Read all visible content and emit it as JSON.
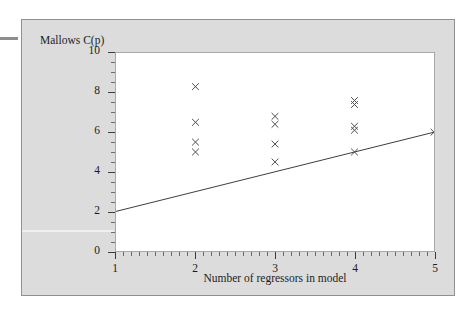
{
  "chart_data": {
    "type": "scatter",
    "title": "",
    "xlabel": "Number of regressors in model",
    "ylabel": "Mallows C(p)",
    "xlim": [
      1,
      5
    ],
    "ylim": [
      0,
      10
    ],
    "xticks": [
      "1",
      "2",
      "3",
      "4",
      "5"
    ],
    "yticks": [
      "0",
      "2",
      "4",
      "6",
      "8",
      "10"
    ],
    "grid": false,
    "legend": null,
    "marker": "x",
    "points": [
      {
        "x": 2,
        "y": 8.3
      },
      {
        "x": 2,
        "y": 6.5
      },
      {
        "x": 2,
        "y": 5.5
      },
      {
        "x": 2,
        "y": 5.0
      },
      {
        "x": 3,
        "y": 6.8
      },
      {
        "x": 3,
        "y": 6.4
      },
      {
        "x": 3,
        "y": 5.4
      },
      {
        "x": 3,
        "y": 4.5
      },
      {
        "x": 4,
        "y": 7.6
      },
      {
        "x": 4,
        "y": 7.4
      },
      {
        "x": 4,
        "y": 6.3
      },
      {
        "x": 4,
        "y": 6.1
      },
      {
        "x": 4,
        "y": 5.0
      },
      {
        "x": 5,
        "y": 6.0
      }
    ],
    "reference_line": {
      "name": "Cp = p line",
      "x_start": 1,
      "y_start": 2.0,
      "x_end": 5,
      "y_end": 6.0
    }
  },
  "axes": {
    "y_title": "Mallows C(p)",
    "x_title": "Number of regressors in model",
    "y_tick_labels": [
      "10",
      "8",
      "6",
      "4",
      "2",
      "0"
    ],
    "x_tick_labels": [
      "1",
      "2",
      "3",
      "4",
      "5"
    ]
  },
  "style": {
    "figure_background": "#dcdcdc",
    "plot_background": "#ffffff",
    "frame_color": "#909090",
    "marker_color": "#4a4a4a",
    "line_color": "#3c3c3c",
    "text_color": "#1c1c1c"
  }
}
